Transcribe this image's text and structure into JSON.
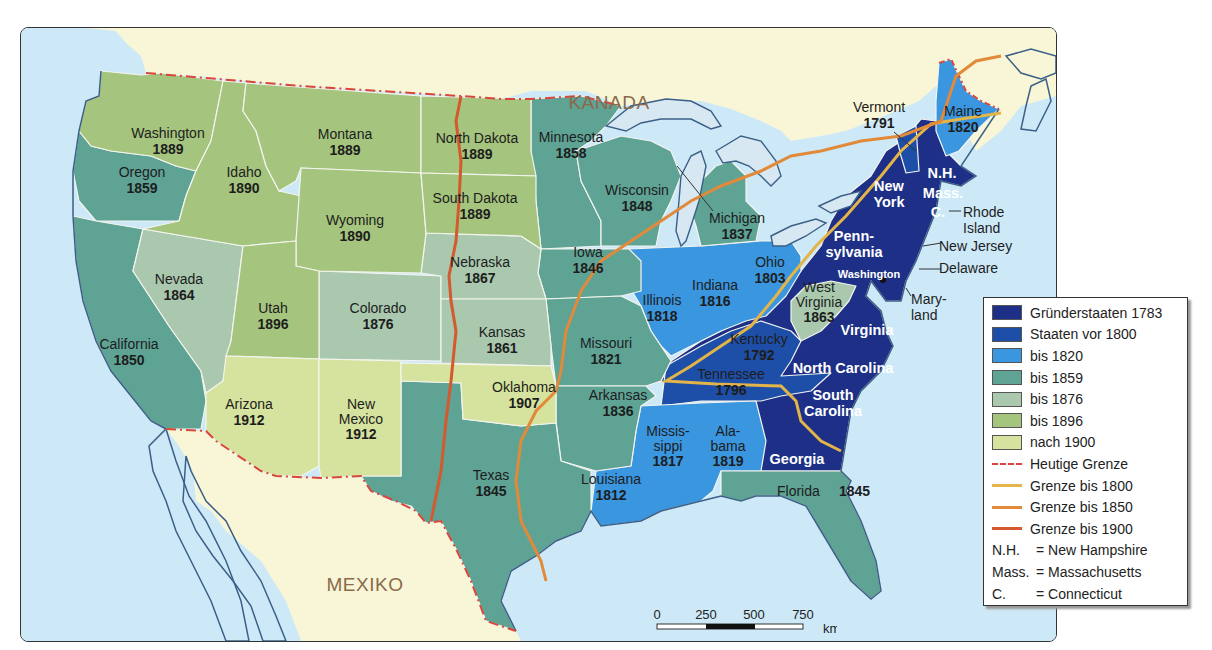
{
  "colors": {
    "founding_1783": "#1d2f86",
    "before_1800": "#1d4fa8",
    "until_1820": "#3a96df",
    "until_1859": "#5fa395",
    "until_1876": "#a9c8ae",
    "until_1896": "#a5c47d",
    "after_1900": "#d6e39e",
    "water": "#cde9f8",
    "foreign_land": "#f8f6d6",
    "border_today": "#d8473a",
    "border_1800": "#e2b449",
    "border_1850": "#e08a3a",
    "border_1900": "#d4592e"
  },
  "countries": {
    "canada": "KANADA",
    "mexico": "MEXIKO"
  },
  "states": [
    {
      "name": "Washington",
      "year": "1889"
    },
    {
      "name": "Oregon",
      "year": "1859"
    },
    {
      "name": "California",
      "year": "1850"
    },
    {
      "name": "Idaho",
      "year": "1890"
    },
    {
      "name": "Nevada",
      "year": "1864"
    },
    {
      "name": "Montana",
      "year": "1889"
    },
    {
      "name": "Wyoming",
      "year": "1890"
    },
    {
      "name": "Utah",
      "year": "1896"
    },
    {
      "name": "Colorado",
      "year": "1876"
    },
    {
      "name": "Arizona",
      "year": "1912"
    },
    {
      "name": "New Mexico",
      "year": "1912",
      "lines": [
        "New",
        "Mexico"
      ]
    },
    {
      "name": "North Dakota",
      "year": "1889"
    },
    {
      "name": "South Dakota",
      "year": "1889"
    },
    {
      "name": "Nebraska",
      "year": "1867"
    },
    {
      "name": "Kansas",
      "year": "1861"
    },
    {
      "name": "Oklahoma",
      "year": "1907"
    },
    {
      "name": "Texas",
      "year": "1845"
    },
    {
      "name": "Minnesota",
      "year": "1858"
    },
    {
      "name": "Iowa",
      "year": "1846"
    },
    {
      "name": "Missouri",
      "year": "1821"
    },
    {
      "name": "Arkansas",
      "year": "1836"
    },
    {
      "name": "Louisiana",
      "year": "1812"
    },
    {
      "name": "Wisconsin",
      "year": "1848"
    },
    {
      "name": "Michigan",
      "year": "1837"
    },
    {
      "name": "Illinois",
      "year": "1818"
    },
    {
      "name": "Indiana",
      "year": "1816"
    },
    {
      "name": "Ohio",
      "year": "1803"
    },
    {
      "name": "Kentucky",
      "year": "1792"
    },
    {
      "name": "Tennessee",
      "year": "1796"
    },
    {
      "name": "Mississippi",
      "year": "1817",
      "lines": [
        "Missis-",
        "sippi"
      ]
    },
    {
      "name": "Alabama",
      "year": "1819",
      "lines": [
        "Ala-",
        "bama"
      ]
    },
    {
      "name": "West Virginia",
      "year": "1863",
      "lines": [
        "West",
        "Virginia"
      ]
    },
    {
      "name": "Florida",
      "year": "1845"
    },
    {
      "name": "Vermont",
      "year": "1791"
    },
    {
      "name": "Maine",
      "year": "1820"
    },
    {
      "name": "New York",
      "lines": [
        "New",
        "York"
      ]
    },
    {
      "name": "Pennsylvania",
      "lines": [
        "Penn-",
        "sylvania"
      ]
    },
    {
      "name": "Virginia"
    },
    {
      "name": "North Carolina"
    },
    {
      "name": "South Carolina",
      "lines": [
        "South",
        "Carolina"
      ]
    },
    {
      "name": "Georgia"
    },
    {
      "name": "N.H."
    },
    {
      "name": "Mass."
    },
    {
      "name": "C."
    },
    {
      "name": "Rhode Island",
      "lines": [
        "Rhode",
        "Island"
      ]
    },
    {
      "name": "New Jersey"
    },
    {
      "name": "Delaware"
    },
    {
      "name": "Maryland",
      "lines": [
        "Mary-",
        "land"
      ]
    }
  ],
  "capital": "Washington",
  "legend": {
    "items": [
      {
        "label": "Gründerstaaten 1783"
      },
      {
        "label": "Staaten vor 1800"
      },
      {
        "label": "bis 1820"
      },
      {
        "label": "bis 1859"
      },
      {
        "label": "bis 1876"
      },
      {
        "label": "bis 1896"
      },
      {
        "label": "nach 1900"
      },
      {
        "label": "Heutige Grenze"
      },
      {
        "label": "Grenze bis 1800"
      },
      {
        "label": "Grenze bis 1850"
      },
      {
        "label": "Grenze bis 1900"
      }
    ],
    "abbreviations": [
      {
        "abbr": "N.H.",
        "text": "= New Hampshire"
      },
      {
        "abbr": "Mass.",
        "text": "= Massachusetts"
      },
      {
        "abbr": "C.",
        "text": "= Connecticut"
      }
    ]
  },
  "scale": {
    "ticks": [
      "0",
      "250",
      "500",
      "750"
    ],
    "unit": "km"
  }
}
